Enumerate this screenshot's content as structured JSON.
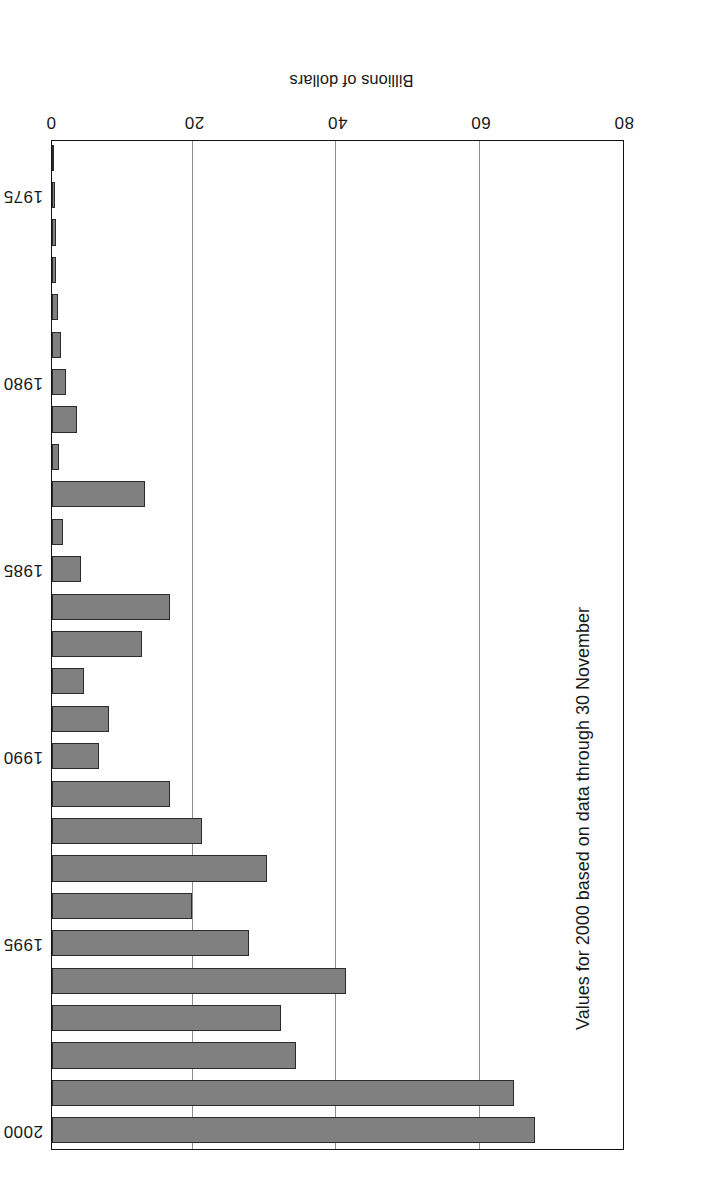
{
  "chart_data": {
    "type": "bar",
    "orientation": "horizontal",
    "title": "",
    "subtitle": "",
    "xlabel": "Billions of dollars",
    "ylabel": "",
    "categories": [
      "1974",
      "1975",
      "1976",
      "1977",
      "1978",
      "1979",
      "1980",
      "1981",
      "1982",
      "1983",
      "1984",
      "1985",
      "1986",
      "1987",
      "1988",
      "1989",
      "1990",
      "1991",
      "1992",
      "1993",
      "1994",
      "1995",
      "1996",
      "1997",
      "1998",
      "1999",
      "2000"
    ],
    "values": [
      0.3,
      0.4,
      0.5,
      0.6,
      0.8,
      1.2,
      2.0,
      3.5,
      1.0,
      13.0,
      1.5,
      4.0,
      16.5,
      12.5,
      4.5,
      8.0,
      6.5,
      16.5,
      21.0,
      30.0,
      19.5,
      27.5,
      41.0,
      32.0,
      34.0,
      64.5,
      67.5
    ],
    "value_axis_ticks": [
      "0",
      "20",
      "40",
      "60",
      "80"
    ],
    "value_axis_tick_values": [
      0,
      20,
      40,
      60,
      80
    ],
    "category_axis_ticks": [
      "1975",
      "1980",
      "1985",
      "1990",
      "1995",
      "2000"
    ],
    "xlim": [
      0,
      80
    ],
    "grid": "vertical gridlines at 20, 40, 60",
    "legend": "none",
    "annotations": [
      "Values for 2000 based on data through 30 November"
    ],
    "bar_color": "#808080",
    "bar_edge_color": "#2b2b2b",
    "grid_color": "#8d8d8d",
    "page_rotation": "180"
  },
  "axis": {
    "value_title": "Billions of dollars",
    "tick_0": "0",
    "tick_20": "20",
    "tick_40": "40",
    "tick_60": "60",
    "tick_80": "80",
    "year_1975": "1975",
    "year_1980": "1980",
    "year_1985": "1985",
    "year_1990": "1990",
    "year_1995": "1995",
    "year_2000": "2000"
  },
  "note": {
    "text": "Values for 2000 based on data through 30 November"
  }
}
